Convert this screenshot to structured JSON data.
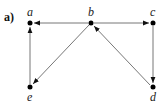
{
  "diagram": {
    "part_label": "a)",
    "nodes": [
      {
        "id": "a",
        "label": "a",
        "x": 30,
        "y": 23,
        "label_pos": "above"
      },
      {
        "id": "b",
        "label": "b",
        "x": 91,
        "y": 23,
        "label_pos": "above"
      },
      {
        "id": "c",
        "label": "c",
        "x": 153,
        "y": 23,
        "label_pos": "above"
      },
      {
        "id": "d",
        "label": "d",
        "x": 153,
        "y": 87,
        "label_pos": "below"
      },
      {
        "id": "e",
        "label": "e",
        "x": 30,
        "y": 87,
        "label_pos": "below"
      }
    ],
    "edges": [
      {
        "from": "b",
        "to": "a"
      },
      {
        "from": "b",
        "to": "c"
      },
      {
        "from": "b",
        "to": "e"
      },
      {
        "from": "e",
        "to": "a"
      },
      {
        "from": "c",
        "to": "d"
      },
      {
        "from": "d",
        "to": "b"
      }
    ],
    "colors": {
      "edge": "#777777",
      "node": "#000000",
      "arrow": "#111111"
    }
  }
}
